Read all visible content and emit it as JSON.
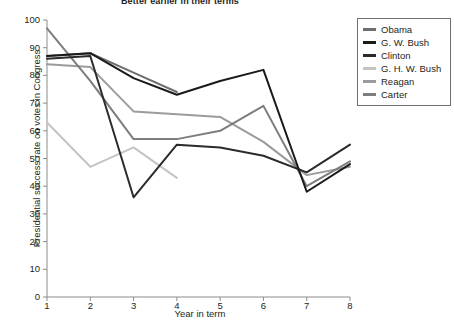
{
  "chart_data": {
    "type": "line",
    "title": "Better earlier in their terms",
    "xlabel": "Year in term",
    "ylabel": "Presidential success rate on votes in Congress",
    "x": [
      1,
      2,
      3,
      4,
      5,
      6,
      7,
      8
    ],
    "xlim": [
      1,
      8
    ],
    "ylim": [
      0,
      100
    ],
    "yticks": [
      0,
      10,
      20,
      30,
      40,
      50,
      60,
      70,
      80,
      90,
      100
    ],
    "xticks": [
      1,
      2,
      3,
      4,
      5,
      6,
      7,
      8
    ],
    "grid": false,
    "legend_position": "right",
    "series": [
      {
        "name": "Obama",
        "color": "#6e6e6e",
        "x": [
          1,
          2,
          3,
          4
        ],
        "values": [
          87,
          88,
          81,
          74
        ]
      },
      {
        "name": "G. W. Bush",
        "color": "#1a1a1a",
        "x": [
          1,
          2,
          3,
          4,
          5,
          6,
          7,
          8
        ],
        "values": [
          87,
          88,
          79,
          73,
          78,
          82,
          38,
          48
        ]
      },
      {
        "name": "Clinton",
        "color": "#2b2b2b",
        "x": [
          1,
          2,
          3,
          4,
          5,
          6,
          7,
          8
        ],
        "values": [
          86,
          87,
          36,
          55,
          54,
          51,
          45,
          55
        ]
      },
      {
        "name": "G. H. W. Bush",
        "color": "#c4c4c4",
        "x": [
          1,
          2,
          3,
          4
        ],
        "values": [
          63,
          47,
          54,
          43
        ]
      },
      {
        "name": "Reagan",
        "color": "#9b9b9b",
        "x": [
          1,
          2,
          3,
          4,
          5,
          6,
          7,
          8
        ],
        "values": [
          84,
          83,
          67,
          66,
          65,
          56,
          44,
          47
        ]
      },
      {
        "name": "Carter",
        "color": "#7d7d7d",
        "x": [
          1,
          2,
          3,
          4,
          5,
          6,
          7,
          8
        ],
        "values": [
          97,
          78,
          57,
          57,
          60,
          69,
          40,
          49
        ]
      }
    ]
  },
  "axis": {
    "color": "#8c8c8c",
    "tick_color": "#8c8c8c"
  }
}
